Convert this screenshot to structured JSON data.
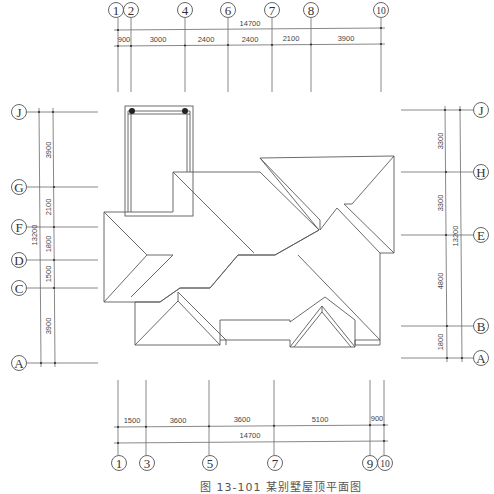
{
  "figure": {
    "title": "屋顶平面图",
    "caption": "图 13-101   某别墅屋顶平面图"
  },
  "top_axes": {
    "labels": [
      "1",
      "2",
      "4",
      "6",
      "7",
      "8",
      "10"
    ],
    "x": [
      118,
      131,
      185,
      228,
      272,
      311,
      381
    ],
    "total": "14700",
    "segments": [
      "900",
      "3000",
      "2400",
      "2400",
      "2100",
      "3900"
    ]
  },
  "bottom_axes": {
    "labels": [
      "1",
      "3",
      "5",
      "7",
      "9",
      "10"
    ],
    "x": [
      118,
      146,
      209,
      274,
      370,
      384
    ],
    "segments": [
      "1500",
      "3600",
      "3600",
      "5100",
      "900"
    ],
    "total": "14700"
  },
  "left_axes": {
    "labels": [
      "J",
      "G",
      "F",
      "D",
      "C",
      "A"
    ],
    "y": [
      112,
      187,
      227,
      260,
      288,
      363
    ],
    "segments": [
      "3900",
      "2100",
      "1800",
      "1500",
      "3900"
    ],
    "total": "13200"
  },
  "right_axes": {
    "labels": [
      "J",
      "H",
      "E",
      "B",
      "A"
    ],
    "y": [
      110,
      172,
      235,
      326,
      358
    ],
    "segments": [
      "3300",
      "3300",
      "4800",
      "1800"
    ],
    "total": "13200"
  }
}
